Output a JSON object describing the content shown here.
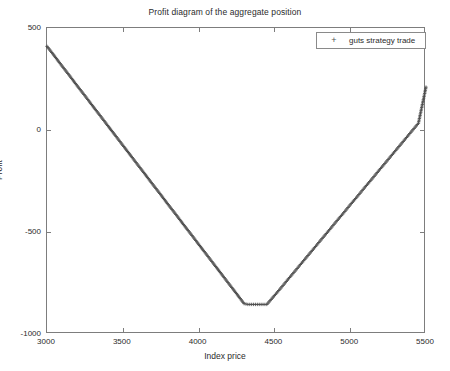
{
  "chart_data": {
    "type": "line",
    "title": "Profit diagram of the aggregate position",
    "xlabel": "Index price",
    "ylabel": "Profit",
    "xlim": [
      3000,
      5500
    ],
    "ylim": [
      -1000,
      500
    ],
    "xticks": [
      3000,
      3500,
      4000,
      4500,
      5000,
      5500
    ],
    "yticks": [
      500,
      0,
      -500,
      -1000
    ],
    "xtick_labels": [
      "3000",
      "3500",
      "4000",
      "4500",
      "5000",
      "5500"
    ],
    "ytick_labels": [
      "500",
      "0",
      "-500",
      "-1000"
    ],
    "grid": false,
    "legend_position": "top-right",
    "marker": "+",
    "series": [
      {
        "name": "guts strategy trade",
        "marker": "+",
        "color": "#4a4a4a",
        "x": [
          3000,
          3050,
          3100,
          3150,
          3200,
          3250,
          3300,
          3350,
          3400,
          3450,
          3500,
          3550,
          3600,
          3650,
          3700,
          3750,
          3800,
          3850,
          3900,
          3950,
          4000,
          4050,
          4100,
          4150,
          4200,
          4250,
          4300,
          4325,
          4350,
          4375,
          4400,
          4425,
          4450,
          4500,
          4550,
          4600,
          4650,
          4700,
          4750,
          4800,
          4850,
          4900,
          4950,
          5000,
          5050,
          5100,
          5150,
          5200,
          5250,
          5300,
          5350,
          5400,
          5450,
          5500
        ],
        "y": [
          410,
          362,
          313,
          265,
          216,
          168,
          119,
          71,
          22,
          -26,
          -75,
          -123,
          -172,
          -220,
          -269,
          -317,
          -366,
          -414,
          -463,
          -511,
          -560,
          -608,
          -657,
          -705,
          -754,
          -802,
          -851,
          -855,
          -855,
          -855,
          -855,
          -855,
          -855,
          -812,
          -768,
          -723,
          -679,
          -634,
          -590,
          -545,
          -501,
          -456,
          -412,
          -367,
          -323,
          -278,
          -234,
          -189,
          -145,
          -100,
          -56,
          -11,
          33,
          210
        ]
      }
    ],
    "annotations": {
      "start_value": 410,
      "min_value": -855,
      "min_range": [
        4300,
        4450
      ],
      "end_value": 210
    }
  },
  "legend": {
    "marker_symbol": "+",
    "label": "guts strategy trade"
  }
}
